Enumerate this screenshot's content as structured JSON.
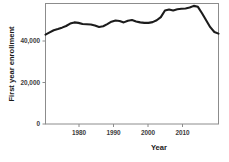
{
  "chart_data": {
    "type": "line",
    "title": "",
    "subtitle": "",
    "xlabel": "Year",
    "ylabel": "First year enrollment",
    "xlim": [
      1973,
      2015
    ],
    "ylim": [
      0,
      50400
    ],
    "grid": false,
    "legend": null,
    "legend_position": "none",
    "line_color": "#1c1c1c",
    "axis_color": "#8c8c8c",
    "xticks": [
      1980,
      1990,
      2000,
      2010
    ],
    "xtick_labels": [
      "1980",
      "1990",
      "2000",
      "2010"
    ],
    "yticks": [
      0,
      20000,
      40000
    ],
    "ytick_labels": [
      "0",
      "20,000",
      "40,000"
    ],
    "series": [
      {
        "name": "First year enrollment",
        "x": [
          1973,
          1974,
          1975,
          1976,
          1977,
          1978,
          1979,
          1980,
          1981,
          1982,
          1983,
          1984,
          1985,
          1986,
          1987,
          1988,
          1989,
          1990,
          1991,
          1992,
          1993,
          1994,
          1995,
          1996,
          1997,
          1998,
          1999,
          2000,
          2001,
          2002,
          2003,
          2004,
          2005,
          2006,
          2007,
          2008,
          2009,
          2010,
          2011,
          2012,
          2013,
          2014,
          2015
        ],
        "values": [
          37400,
          38300,
          39200,
          39700,
          40300,
          41000,
          42000,
          42500,
          42300,
          41800,
          41700,
          41600,
          41200,
          40600,
          40900,
          41800,
          42800,
          43300,
          43100,
          42500,
          43200,
          43500,
          42900,
          42500,
          42300,
          42300,
          42600,
          43400,
          44700,
          47500,
          47900,
          47500,
          48000,
          48200,
          48300,
          48700,
          49400,
          49000,
          46300,
          43400,
          40500,
          38500,
          37800
        ]
      }
    ]
  },
  "axis": {
    "ylabel": "First year enrollment",
    "xlabel": "Year"
  }
}
